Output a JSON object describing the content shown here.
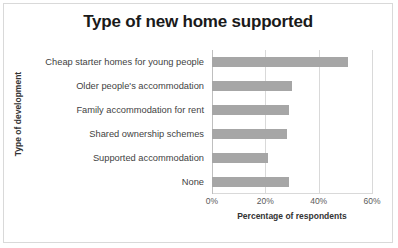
{
  "chart_data": {
    "type": "bar",
    "orientation": "horizontal",
    "title": "Type of new home supported",
    "xlabel": "Percentage of respondents",
    "ylabel": "Type of development",
    "categories": [
      "Cheap starter homes for young people",
      "Older people's accommodation",
      "Family accommodation for rent",
      "Shared ownership schemes",
      "Supported accommodation",
      "None"
    ],
    "values": [
      51,
      30,
      29,
      28,
      21,
      29
    ],
    "xlim": [
      0,
      60
    ],
    "xticks": [
      0,
      20,
      40,
      60
    ],
    "xtick_labels": [
      "0%",
      "20%",
      "40%",
      "60%"
    ],
    "grid": true,
    "legend": "none",
    "bar_color": "#a6a6a6",
    "gridline_color": "#d9d9d9",
    "title_color": "#1a1a1a",
    "border_color": "#d9d9d9",
    "background_color": "#ffffff"
  }
}
